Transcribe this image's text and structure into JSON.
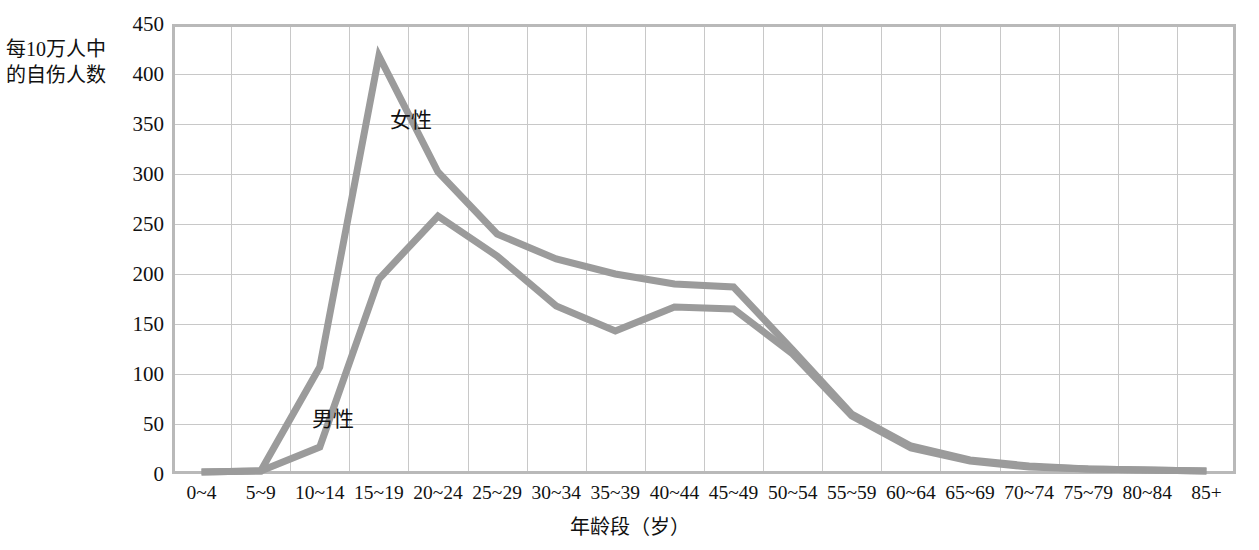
{
  "chart_data": {
    "type": "line",
    "title": "",
    "xlabel": "年龄段（岁）",
    "ylabel": "每10万人中的自伤人数",
    "ylabel_lines": [
      "每10万人中",
      "的自伤人数"
    ],
    "categories": [
      "0~4",
      "5~9",
      "10~14",
      "15~19",
      "20~24",
      "25~29",
      "30~34",
      "35~39",
      "40~44",
      "45~49",
      "50~54",
      "55~59",
      "60~64",
      "65~69",
      "70~74",
      "75~79",
      "80~84",
      "85+"
    ],
    "ylim": [
      0,
      450
    ],
    "yticks": [
      0,
      50,
      100,
      150,
      200,
      250,
      300,
      350,
      400,
      450
    ],
    "grid": true,
    "legend_position": "inline-annotations",
    "series": [
      {
        "name": "女性",
        "color": "#9b9b9b",
        "values": [
          2,
          3,
          107,
          418,
          302,
          240,
          215,
          200,
          190,
          187,
          124,
          60,
          28,
          14,
          8,
          5,
          4,
          3
        ]
      },
      {
        "name": "男性",
        "color": "#9b9b9b",
        "values": [
          2,
          3,
          27,
          195,
          258,
          218,
          168,
          143,
          167,
          165,
          120,
          58,
          26,
          13,
          7,
          5,
          4,
          3
        ]
      }
    ],
    "annotations": [
      {
        "text": "女性",
        "series": "女性"
      },
      {
        "text": "男性",
        "series": "男性"
      }
    ]
  },
  "colors": {
    "line": "#9b9b9b",
    "gridline": "#c8c8c8",
    "plot_border": "#b9b9b9",
    "text": "#111111",
    "background": "#ffffff"
  }
}
